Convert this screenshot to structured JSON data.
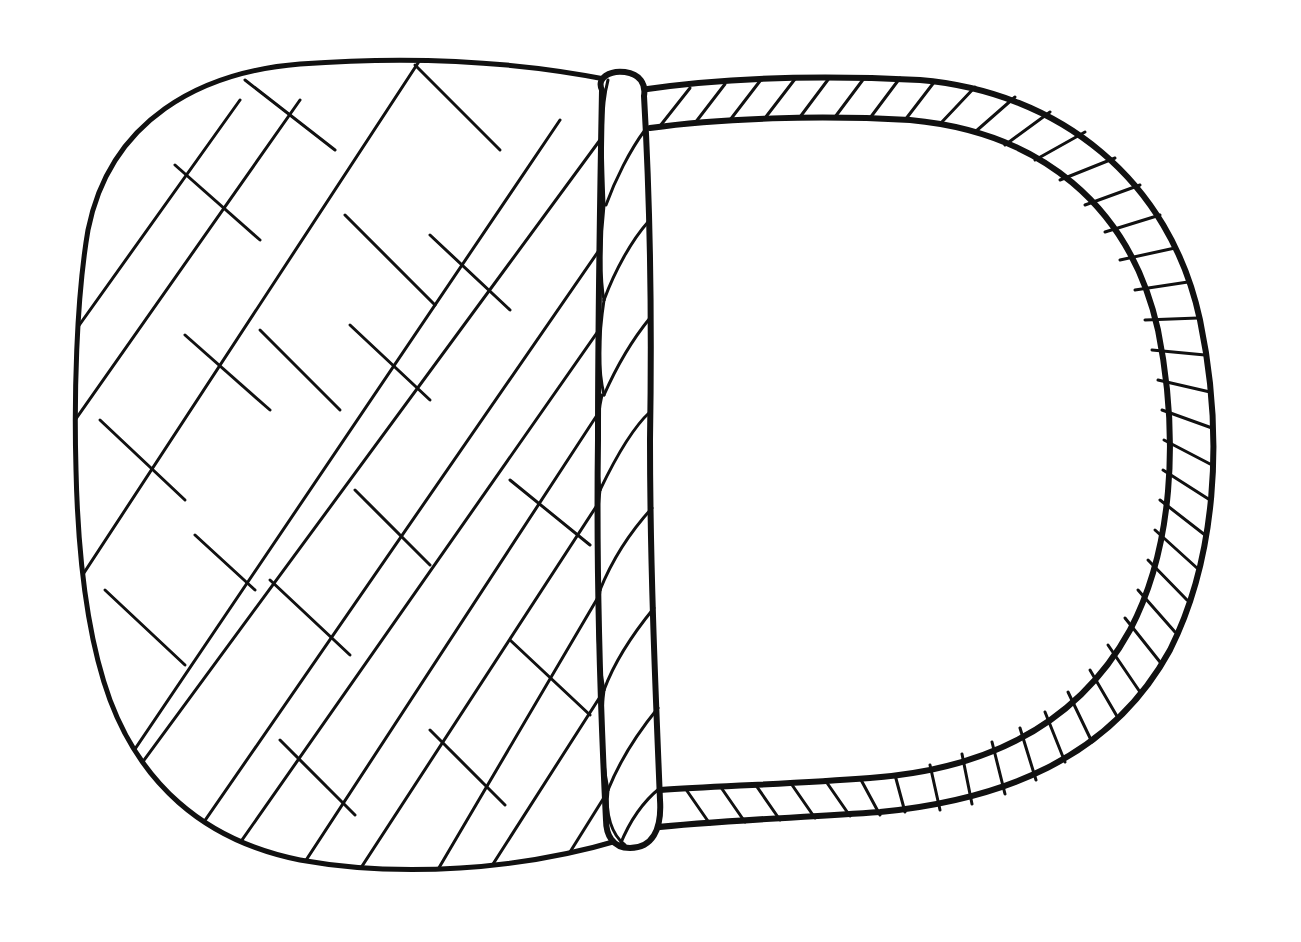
{
  "image": {
    "subject": "Line drawing of a woven basket with a twisted rope handle (rotated sideways)",
    "style": "black-and-white coloring-page line art",
    "colors": {
      "ink": "#111111",
      "paper": "#ffffff"
    },
    "parts": [
      {
        "name": "basket-body",
        "description": "Rounded basket body with diagonal lattice weave"
      },
      {
        "name": "rope-rim",
        "description": "Vertical twisted rope rim along the basket opening"
      },
      {
        "name": "rope-handle",
        "description": "D-shaped twisted rope handle"
      }
    ]
  }
}
